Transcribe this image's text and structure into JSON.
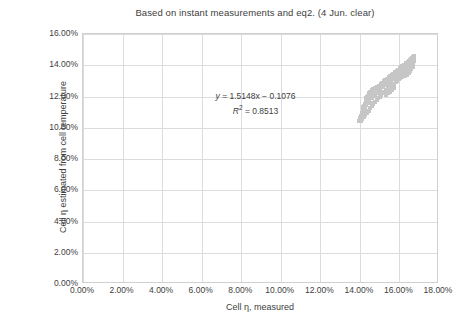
{
  "chart_data": {
    "type": "scatter",
    "title": "Based on instant measurements and eq2. (4 Jun. clear)",
    "xlabel": "Cell η, measured",
    "ylabel": "Cell η estimated from cell temperature",
    "xlim": [
      0,
      18
    ],
    "ylim": [
      0,
      16
    ],
    "xtick_labels": [
      "0.00%",
      "2.00%",
      "4.00%",
      "6.00%",
      "8.00%",
      "10.00%",
      "12.00%",
      "14.00%",
      "16.00%",
      "18.00%"
    ],
    "xtick_values": [
      0,
      2,
      4,
      6,
      8,
      10,
      12,
      14,
      16,
      18
    ],
    "ytick_labels": [
      "0.00%",
      "2.00%",
      "4.00%",
      "6.00%",
      "8.00%",
      "10.00%",
      "12.00%",
      "14.00%",
      "16.00%"
    ],
    "ytick_values": [
      0,
      2,
      4,
      6,
      8,
      10,
      12,
      14,
      16
    ],
    "grid": true,
    "legend": "none",
    "marker_color": "#c6c6c6",
    "annotations": {
      "equation": "y = 1.5148x − 0.1076",
      "equation_slope": 1.5148,
      "equation_intercept": -0.1076,
      "r_squared_label": "R² = 0.8513",
      "r_squared": 0.8513
    },
    "series": [
      {
        "name": "Cell efficiency",
        "points": [
          [
            13.95,
            10.42
          ],
          [
            14.0,
            10.5
          ],
          [
            14.02,
            10.62
          ],
          [
            14.05,
            10.55
          ],
          [
            14.07,
            10.74
          ],
          [
            14.08,
            10.86
          ],
          [
            14.1,
            10.68
          ],
          [
            14.12,
            10.95
          ],
          [
            14.14,
            11.05
          ],
          [
            14.15,
            10.8
          ],
          [
            14.17,
            11.18
          ],
          [
            14.18,
            11.3
          ],
          [
            14.2,
            11.02
          ],
          [
            14.22,
            11.42
          ],
          [
            14.24,
            11.2
          ],
          [
            14.25,
            11.55
          ],
          [
            14.27,
            11.35
          ],
          [
            14.29,
            11.66
          ],
          [
            14.3,
            11.48
          ],
          [
            14.32,
            11.78
          ],
          [
            14.34,
            11.58
          ],
          [
            14.36,
            11.9
          ],
          [
            14.38,
            11.7
          ],
          [
            14.4,
            12.02
          ],
          [
            14.42,
            11.84
          ],
          [
            14.44,
            12.12
          ],
          [
            14.46,
            11.96
          ],
          [
            14.48,
            12.22
          ],
          [
            14.5,
            12.06
          ],
          [
            14.53,
            12.32
          ],
          [
            14.56,
            12.16
          ],
          [
            14.6,
            12.4
          ],
          [
            14.64,
            12.26
          ],
          [
            14.68,
            12.48
          ],
          [
            14.72,
            12.34
          ],
          [
            14.76,
            12.54
          ],
          [
            14.8,
            12.42
          ],
          [
            14.85,
            12.6
          ],
          [
            14.9,
            12.5
          ],
          [
            14.95,
            12.66
          ],
          [
            15.0,
            12.56
          ],
          [
            15.05,
            12.72
          ],
          [
            15.1,
            12.62
          ],
          [
            15.15,
            12.78
          ],
          [
            15.18,
            12.68
          ],
          [
            15.22,
            12.84
          ],
          [
            15.26,
            12.74
          ],
          [
            15.3,
            12.9
          ],
          [
            15.34,
            12.8
          ],
          [
            15.38,
            12.96
          ],
          [
            15.42,
            12.88
          ],
          [
            15.46,
            13.04
          ],
          [
            15.5,
            12.96
          ],
          [
            15.54,
            13.12
          ],
          [
            15.58,
            13.04
          ],
          [
            15.62,
            13.2
          ],
          [
            15.66,
            13.12
          ],
          [
            15.7,
            13.28
          ],
          [
            15.74,
            13.2
          ],
          [
            15.78,
            13.36
          ],
          [
            15.82,
            13.28
          ],
          [
            15.86,
            13.44
          ],
          [
            15.9,
            13.36
          ],
          [
            15.94,
            13.52
          ],
          [
            15.98,
            13.44
          ],
          [
            16.02,
            13.6
          ],
          [
            16.05,
            13.52
          ],
          [
            16.09,
            13.68
          ],
          [
            16.12,
            13.6
          ],
          [
            16.16,
            13.76
          ],
          [
            16.19,
            13.68
          ],
          [
            16.22,
            13.84
          ],
          [
            16.25,
            13.76
          ],
          [
            16.28,
            13.92
          ],
          [
            16.31,
            13.84
          ],
          [
            16.34,
            14.0
          ],
          [
            16.37,
            13.92
          ],
          [
            16.4,
            14.08
          ],
          [
            16.42,
            14.0
          ],
          [
            16.45,
            14.16
          ],
          [
            16.47,
            14.08
          ],
          [
            16.5,
            14.24
          ],
          [
            16.52,
            14.16
          ],
          [
            16.55,
            14.32
          ],
          [
            16.57,
            14.24
          ],
          [
            16.6,
            14.4
          ],
          [
            16.62,
            14.32
          ],
          [
            16.65,
            14.48
          ],
          [
            16.67,
            14.4
          ],
          [
            16.7,
            14.56
          ],
          [
            16.72,
            14.48
          ],
          [
            16.74,
            14.6
          ],
          [
            14.05,
            10.46
          ],
          [
            14.12,
            10.58
          ],
          [
            14.2,
            10.7
          ],
          [
            14.28,
            10.82
          ],
          [
            14.36,
            10.94
          ],
          [
            14.44,
            11.08
          ],
          [
            14.52,
            11.24
          ],
          [
            14.6,
            11.38
          ],
          [
            14.68,
            11.52
          ],
          [
            14.76,
            11.64
          ],
          [
            14.84,
            11.76
          ],
          [
            14.92,
            11.88
          ],
          [
            15.0,
            12.0
          ],
          [
            15.08,
            12.1
          ],
          [
            15.16,
            12.2
          ],
          [
            15.24,
            12.3
          ],
          [
            15.32,
            12.4
          ],
          [
            15.4,
            12.5
          ],
          [
            15.48,
            12.58
          ],
          [
            15.56,
            12.66
          ],
          [
            15.64,
            12.74
          ],
          [
            15.72,
            12.82
          ],
          [
            15.8,
            12.92
          ],
          [
            15.88,
            13.0
          ],
          [
            15.96,
            13.1
          ],
          [
            16.04,
            13.18
          ],
          [
            16.12,
            13.28
          ],
          [
            16.2,
            13.38
          ],
          [
            16.28,
            13.48
          ],
          [
            16.36,
            13.58
          ],
          [
            16.44,
            13.7
          ],
          [
            16.52,
            13.8
          ],
          [
            16.58,
            13.9
          ],
          [
            16.64,
            14.02
          ],
          [
            16.68,
            14.14
          ],
          [
            16.71,
            14.26
          ],
          [
            14.3,
            11.9
          ],
          [
            14.35,
            11.98
          ],
          [
            14.4,
            11.8
          ],
          [
            14.48,
            11.7
          ],
          [
            14.55,
            11.6
          ],
          [
            14.62,
            11.92
          ],
          [
            14.7,
            12.04
          ],
          [
            14.78,
            12.14
          ],
          [
            14.86,
            12.24
          ],
          [
            14.94,
            12.34
          ],
          [
            15.02,
            12.44
          ],
          [
            15.34,
            12.1
          ],
          [
            15.44,
            12.2
          ],
          [
            15.54,
            12.3
          ],
          [
            15.64,
            12.44
          ],
          [
            15.74,
            12.56
          ],
          [
            16.3,
            13.3
          ],
          [
            16.38,
            13.4
          ],
          [
            16.46,
            13.5
          ],
          [
            16.54,
            13.62
          ],
          [
            16.6,
            13.74
          ],
          [
            16.66,
            13.86
          ],
          [
            16.7,
            13.98
          ],
          [
            16.73,
            14.36
          ],
          [
            14.1,
            10.9
          ],
          [
            14.16,
            11.12
          ],
          [
            14.22,
            11.26
          ],
          [
            14.26,
            11.44
          ],
          [
            14.33,
            11.62
          ],
          [
            14.41,
            11.86
          ],
          [
            14.49,
            12.08
          ],
          [
            14.57,
            12.28
          ],
          [
            14.65,
            12.38
          ],
          [
            14.73,
            12.46
          ],
          [
            14.81,
            12.52
          ],
          [
            14.89,
            12.62
          ],
          [
            14.97,
            12.7
          ],
          [
            15.06,
            12.8
          ],
          [
            15.14,
            12.88
          ],
          [
            15.21,
            12.98
          ],
          [
            15.29,
            13.06
          ],
          [
            15.37,
            13.14
          ],
          [
            15.45,
            13.22
          ],
          [
            15.53,
            13.3
          ],
          [
            15.61,
            13.38
          ],
          [
            15.69,
            13.46
          ],
          [
            15.77,
            13.54
          ],
          [
            15.85,
            13.62
          ],
          [
            15.93,
            13.72
          ],
          [
            16.01,
            13.8
          ],
          [
            16.08,
            13.88
          ],
          [
            16.15,
            13.96
          ],
          [
            16.23,
            14.04
          ],
          [
            16.32,
            14.14
          ],
          [
            16.41,
            14.22
          ],
          [
            16.49,
            14.3
          ],
          [
            16.56,
            14.38
          ],
          [
            16.63,
            14.46
          ],
          [
            16.69,
            14.54
          ],
          [
            16.71,
            14.62
          ]
        ]
      }
    ]
  }
}
